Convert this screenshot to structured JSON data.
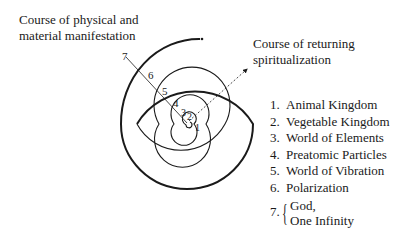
{
  "labels": {
    "physical_course": [
      "Course of physical and",
      "material manifestation"
    ],
    "returning_course": [
      "Course of returning",
      "spiritualization"
    ]
  },
  "spiral": {
    "ring_numbers": [
      "7",
      "6",
      "5",
      "4",
      "3",
      "2",
      "1"
    ],
    "stroke_color": "#1a1a1a"
  },
  "legend": {
    "items": [
      {
        "num": "1.",
        "label": "Animal Kingdom"
      },
      {
        "num": "2.",
        "label": "Vegetable Kingdom"
      },
      {
        "num": "3.",
        "label": "World of Elements"
      },
      {
        "num": "4.",
        "label": "Preatomic Particles"
      },
      {
        "num": "5.",
        "label": "World of Vibration"
      },
      {
        "num": "6.",
        "label": "Polarization"
      }
    ],
    "item7": {
      "num": "7.",
      "lines": [
        "God,",
        "One Infinity"
      ]
    }
  }
}
